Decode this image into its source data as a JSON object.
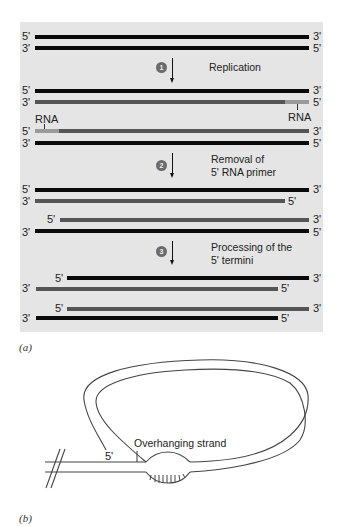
{
  "panel_a": {
    "caption": "(a)",
    "prime5": "5'",
    "prime3": "3'",
    "rna_label": "RNA",
    "steps": [
      {
        "number": "1",
        "text": "Replication"
      },
      {
        "number": "2",
        "line1": "Removal of",
        "line2": "5' RNA primer"
      },
      {
        "number": "3",
        "line1": "Processing of the",
        "line2": "5' termini"
      }
    ]
  },
  "panel_b": {
    "caption": "(b)",
    "overhang_label": "Overhanging strand",
    "prime5": "5'"
  },
  "colors": {
    "panel_bg": "#e5e5e5",
    "parental_dna": "#0a0a0a",
    "new_dna": "#555555",
    "rna_primer": "#9a9a9a"
  }
}
